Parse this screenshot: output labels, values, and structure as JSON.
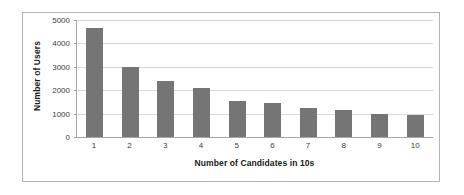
{
  "chart_data": {
    "type": "bar",
    "title": "",
    "xlabel": "Number of Candidates in 10s",
    "ylabel": "Number of Users",
    "categories": [
      "1",
      "2",
      "3",
      "4",
      "5",
      "6",
      "7",
      "8",
      "9",
      "10"
    ],
    "values": [
      4650,
      3000,
      2400,
      2080,
      1550,
      1440,
      1250,
      1160,
      1000,
      920
    ],
    "series": [
      {
        "name": "Number of Users",
        "values": [
          4650,
          3000,
          2400,
          2080,
          1550,
          1440,
          1250,
          1160,
          1000,
          920
        ]
      }
    ],
    "ylim": [
      0,
      5000
    ],
    "yticks": [
      0,
      1000,
      2000,
      3000,
      4000,
      5000
    ],
    "ytick_labels": [
      "0",
      "1000",
      "2000",
      "3000",
      "4000",
      "5000"
    ],
    "grid": "horizontal",
    "legend": "none",
    "bar_color": "#757575",
    "gridline_color": "#d9d9d9",
    "axis_color": "#a6a6a6",
    "background_color": "#ffffff",
    "border_color": "#b5b5b5"
  }
}
